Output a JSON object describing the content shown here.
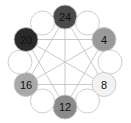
{
  "diagram": {
    "center": [
      65,
      62
    ],
    "ring_radius": 45,
    "node_radius": 12,
    "nodes": [
      {
        "label": "24",
        "angle": 90,
        "fill": "#4a4a4a",
        "text": "#111111"
      },
      {
        "label": "",
        "angle": 60,
        "fill": "#ffffff",
        "text": "#111111"
      },
      {
        "label": "4",
        "angle": 30,
        "fill": "#9a9a9a",
        "text": "#111111"
      },
      {
        "label": "",
        "angle": 0,
        "fill": "#ffffff",
        "text": "#111111"
      },
      {
        "label": "8",
        "angle": -30,
        "fill": "#f2f2f2",
        "text": "#111111"
      },
      {
        "label": "",
        "angle": -60,
        "fill": "#ffffff",
        "text": "#111111"
      },
      {
        "label": "12",
        "angle": -90,
        "fill": "#8a8a8a",
        "text": "#111111"
      },
      {
        "label": "",
        "angle": -120,
        "fill": "#ffffff",
        "text": "#111111"
      },
      {
        "label": "16",
        "angle": -150,
        "fill": "#a8a8a8",
        "text": "#111111"
      },
      {
        "label": "",
        "angle": 180,
        "fill": "#ffffff",
        "text": "#111111"
      },
      {
        "label": "20",
        "angle": 150,
        "fill": "#2a2a2a",
        "text": "#111111"
      },
      {
        "label": "",
        "angle": 120,
        "fill": "#ffffff",
        "text": "#111111"
      }
    ],
    "edges": [
      [
        "24",
        "8"
      ],
      [
        "24",
        "16"
      ],
      [
        "24",
        "12"
      ],
      [
        "4",
        "12"
      ],
      [
        "4",
        "20"
      ],
      [
        "4",
        "16"
      ],
      [
        "8",
        "16"
      ],
      [
        "8",
        "20"
      ],
      [
        "12",
        "20"
      ]
    ],
    "line_color": "#bdbdbd",
    "outline_color": "#c8c8c8"
  }
}
